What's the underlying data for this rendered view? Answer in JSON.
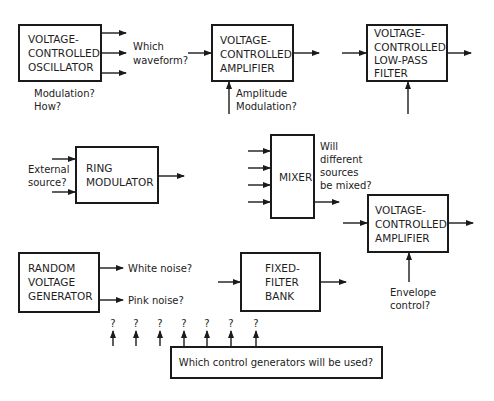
{
  "diagram": {
    "blocks": {
      "vco": {
        "lines": [
          "VOLTAGE-",
          "CONTROLLED",
          "OSCILLATOR"
        ]
      },
      "vca1": {
        "lines": [
          "VOLTAGE-",
          "CONTROLLED",
          "AMPLIFIER"
        ]
      },
      "vcf": {
        "lines": [
          "VOLTAGE-",
          "CONTROLLED",
          "LOW-PASS",
          "FILTER"
        ]
      },
      "ring": {
        "lines": [
          "RING",
          "MODULATOR"
        ]
      },
      "mixer": {
        "lines": [
          "MIXER"
        ]
      },
      "vca2": {
        "lines": [
          "VOLTAGE-",
          "CONTROLLED",
          "AMPLIFIER"
        ]
      },
      "rvg": {
        "lines": [
          "RANDOM",
          "VOLTAGE",
          "GENERATOR"
        ]
      },
      "ffb": {
        "lines": [
          "FIXED-",
          "FILTER",
          "BANK"
        ]
      },
      "control": {
        "label": "Which control generators will be used?"
      }
    },
    "notes": {
      "vco_waveform": [
        "Which",
        "waveform?"
      ],
      "vco_modulation": [
        "Modulation?",
        "How?"
      ],
      "vca1_am": [
        "Amplitude",
        "Modulation?"
      ],
      "ring_external": [
        "External",
        "source?"
      ],
      "mixer_question": [
        "Will",
        "different",
        "sources",
        "be mixed?"
      ],
      "vca2_envelope": [
        "Envelope",
        "control?"
      ],
      "rvg_white": "White noise?",
      "rvg_pink": "Pink noise?"
    },
    "control_outputs": [
      "?",
      "?",
      "?",
      "?",
      "?",
      "?",
      "?"
    ]
  }
}
